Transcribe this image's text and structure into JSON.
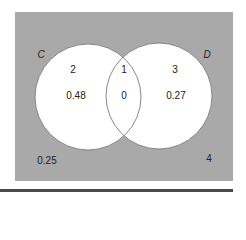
{
  "diagram": {
    "type": "venn",
    "colors": {
      "universe_fill": "#a9a9a9",
      "circle_fill": "#ffffff",
      "circle_stroke": "#7a7a7a",
      "text": "#222222",
      "rule": "#4a4a4a"
    },
    "sets": [
      {
        "name": "C",
        "region_id": "2",
        "probability": "0.48"
      },
      {
        "name": "D",
        "region_id": "3",
        "probability": "0.27"
      }
    ],
    "intersection": {
      "region_id": "1",
      "probability": "0"
    },
    "outside": {
      "region_id": "4",
      "probability": "0.25"
    }
  }
}
